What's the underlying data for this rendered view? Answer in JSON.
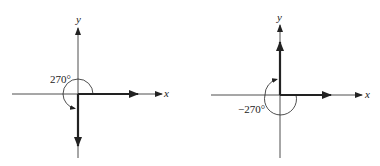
{
  "diagrams": [
    {
      "name": "positive-270",
      "x_label": "x",
      "y_label": "y",
      "angle_label": "270°",
      "initial_side": "positive x-axis",
      "terminal_side": "negative y-axis",
      "rotation": "counterclockwise"
    },
    {
      "name": "negative-270",
      "x_label": "x",
      "y_label": "y",
      "angle_label": "−270°",
      "initial_side": "positive x-axis",
      "terminal_side": "positive y-axis",
      "rotation": "clockwise"
    }
  ],
  "colors": {
    "ink": "#222222",
    "background": "#ffffff"
  }
}
